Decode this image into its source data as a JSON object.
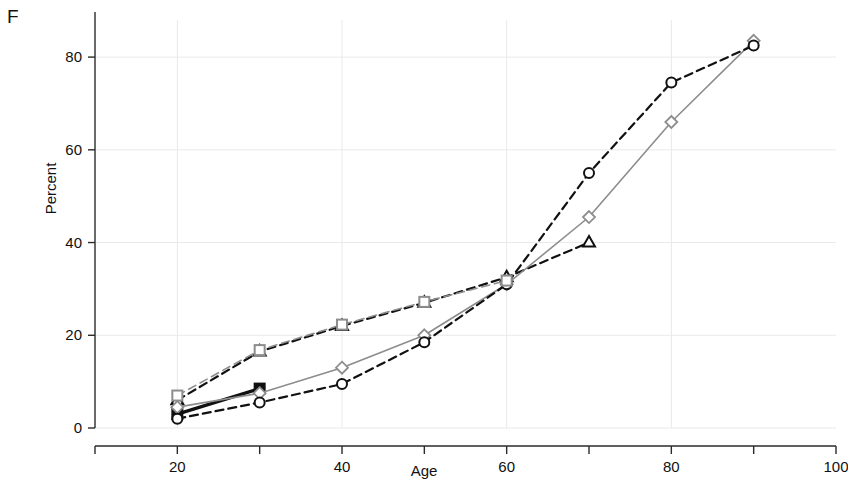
{
  "panel": {
    "label": "F"
  },
  "axis": {
    "xlabel": "Age",
    "ylabel": "Percent",
    "x_tick_labels": [
      "20",
      "40",
      "60",
      "80",
      "100"
    ],
    "y_tick_labels": [
      "0",
      "20",
      "40",
      "60",
      "80"
    ]
  },
  "colors": {
    "black": "#111111",
    "gray": "#8d8d8d",
    "grid": "#e9e9e9",
    "axis": "#2b2b2b",
    "background": "#ffffff"
  },
  "chart_data": {
    "type": "line",
    "title": "F",
    "xlabel": "Age",
    "ylabel": "Percent",
    "xlim": [
      10,
      100
    ],
    "ylim": [
      0,
      88
    ],
    "x_ticks": [
      10,
      20,
      30,
      40,
      50,
      60,
      70,
      80,
      90,
      100
    ],
    "x_tick_labels": [
      "",
      "20",
      "",
      "40",
      "",
      "60",
      "",
      "80",
      "",
      "100"
    ],
    "y_ticks": [
      0,
      20,
      40,
      60,
      80
    ],
    "grid": true,
    "legend": "none",
    "series": [
      {
        "name": "triangle-dashed",
        "marker": "triangle",
        "marker_fill": "none",
        "line_style": "dashed",
        "color": "#111111",
        "x": [
          20,
          30,
          40,
          50,
          60,
          70
        ],
        "values": [
          6.0,
          16.5,
          22.0,
          27.0,
          32.5,
          40.0
        ]
      },
      {
        "name": "square-solid-black",
        "marker": "square",
        "marker_fill": "filled",
        "line_style": "solid",
        "color": "#111111",
        "x": [
          20,
          30
        ],
        "values": [
          3.0,
          8.5
        ]
      },
      {
        "name": "diamond-solid-gray",
        "marker": "diamond",
        "marker_fill": "none",
        "line_style": "solid",
        "color": "#8d8d8d",
        "x": [
          20,
          30,
          40,
          50,
          60,
          70,
          80,
          90
        ],
        "values": [
          4.5,
          7.5,
          13.0,
          20.0,
          31.0,
          45.5,
          66.0,
          83.5
        ]
      },
      {
        "name": "circle-dashed-black",
        "marker": "circle",
        "marker_fill": "none",
        "line_style": "dashed",
        "color": "#111111",
        "x": [
          20,
          30,
          40,
          50,
          60,
          70,
          80,
          90
        ],
        "values": [
          2.0,
          5.5,
          9.5,
          18.5,
          31.0,
          55.0,
          74.5,
          82.5
        ]
      },
      {
        "name": "square-open-dashed-gray",
        "marker": "square",
        "marker_fill": "none",
        "line_style": "dashed",
        "color": "#8d8d8d",
        "x": [
          20,
          30,
          40,
          50,
          60
        ],
        "values": [
          7.0,
          16.8,
          22.3,
          27.2,
          31.8
        ]
      }
    ]
  }
}
